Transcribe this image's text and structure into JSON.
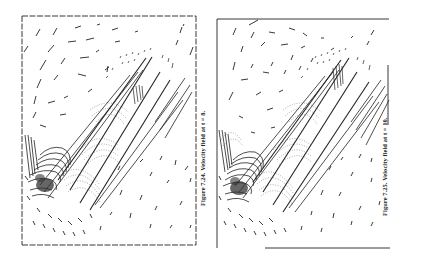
{
  "page": {
    "background": "#ffffff",
    "ink_color": "#222222"
  },
  "figures": [
    {
      "id": "fig-7-24",
      "caption": "Figure 7.24.  Velocity field at t = 8.",
      "label": "Figure 7.24.",
      "title": "Velocity field at t = 8.",
      "time": 8,
      "content": "vector field plot inside a rectangular domain with a diagonal plate"
    },
    {
      "id": "fig-7-25",
      "caption": "Figure 7.25.  Velocity field at t = 10.",
      "label": "Figure 7.25.",
      "title": "Velocity field at t = 10.",
      "time": 10,
      "content": "vector field plot inside a rectangular domain with a diagonal plate"
    }
  ]
}
